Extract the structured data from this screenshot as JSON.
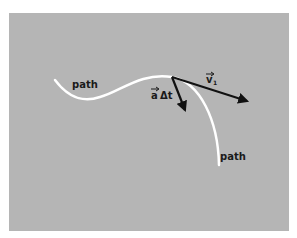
{
  "figure": {
    "background_color": "#ffffff",
    "panel_color": "#b5b5b5",
    "path_color": "#ffffff",
    "vector_color": "#111111"
  },
  "labels": {
    "path_left": "path",
    "path_right": "path",
    "velocity_vector": "v",
    "velocity_subscript": "1",
    "accel_vector_a": "a",
    "accel_delta_t": "Δt"
  }
}
